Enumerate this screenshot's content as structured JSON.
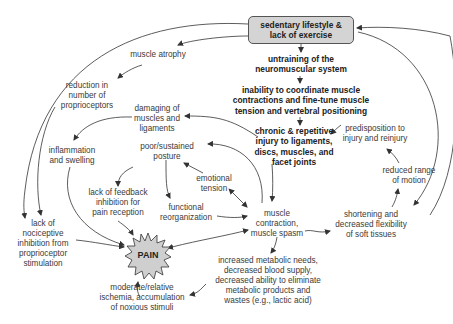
{
  "diagram": {
    "title_box": {
      "line1": "sedentary lifestyle &",
      "line2": "lack of exercise"
    },
    "core_chain": [
      {
        "id": "untraining",
        "lines": [
          "untraining of the",
          "neuromuscular system"
        ]
      },
      {
        "id": "inability",
        "lines": [
          "inability to coordinate muscle",
          "contractions and fine-tune muscle",
          "tension and vertebral positioning"
        ]
      },
      {
        "id": "chronic_injury",
        "lines": [
          "chronic & repetitive",
          "injury to ligaments,",
          "discs, muscles, and",
          "facet joints"
        ]
      }
    ],
    "nodes": {
      "muscle_atrophy": [
        "muscle atrophy"
      ],
      "reduction_proprioceptors": [
        "reduction in",
        "number of",
        "proprioceptors"
      ],
      "damaging": [
        "damaging of",
        "muscles and",
        "ligaments"
      ],
      "inflammation": [
        "inflammation",
        "and swelling"
      ],
      "poor_posture": [
        "poor/sustained",
        "posture"
      ],
      "emotional_tension": [
        "emotional",
        "tension"
      ],
      "lack_feedback": [
        "lack of feedback",
        "inhibition for",
        "pain reception"
      ],
      "functional_reorg": [
        "functional",
        "reorganization"
      ],
      "muscle_contraction": [
        "muscle",
        "contraction,",
        "muscle spasm"
      ],
      "lack_nociceptive": [
        "lack of",
        "nociceptive",
        "inhibition from",
        "proprioceptor",
        "stimulation"
      ],
      "pain": [
        "PAIN"
      ],
      "ischemia": [
        "moderate/relative",
        "ischemia, accumulation",
        "of noxious stimuli"
      ],
      "metabolic": [
        "increased metabolic needs,",
        "decreased blood supply,",
        "decreased ability to eliminate",
        "metabolic products and",
        "wastes (e.g., lactic acid)"
      ],
      "predisposition": [
        "predisposition to",
        "injury and reinjury"
      ],
      "reduced_rom": [
        "reduced range",
        "of motion"
      ],
      "shortening": [
        "shortening and",
        "decreased flexibility",
        "of soft tissues"
      ]
    },
    "colors": {
      "box_fill": "#d4d4d4",
      "pain_fill": "#cfcfcf",
      "line": "#333333",
      "text": "#3a3a3a"
    }
  }
}
